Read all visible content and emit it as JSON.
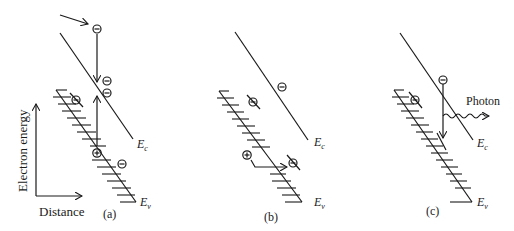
{
  "figure": {
    "axes": {
      "y_label": "Electron energy",
      "x_label": "Distance"
    },
    "panels": [
      {
        "id": "a",
        "caption": "(a)",
        "band_labels": {
          "conduction": "E",
          "conduction_sub": "c",
          "valence": "E",
          "valence_sub": "v"
        },
        "description": "Impact ionization: incoming energetic electron drops down and creates an electron-hole pair"
      },
      {
        "id": "b",
        "caption": "(b)",
        "band_labels": {
          "conduction": "E",
          "conduction_sub": "c",
          "valence": "E",
          "valence_sub": "v"
        },
        "description": "Hole tunneling horizontally through the valence band"
      },
      {
        "id": "c",
        "caption": "(c)",
        "band_labels": {
          "conduction": "E",
          "conduction_sub": "c",
          "valence": "E",
          "valence_sub": "v"
        },
        "photon_label": "Photon",
        "description": "Radiative recombination: electron drops from conduction band emitting a photon"
      }
    ],
    "symbols": {
      "electron": "−",
      "hole": "+"
    },
    "colors": {
      "ink": "#1a1a1a",
      "background": "#ffffff"
    }
  }
}
